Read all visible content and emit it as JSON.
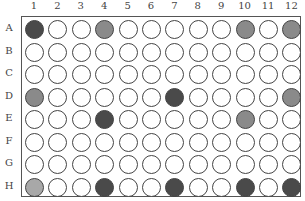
{
  "plate": {
    "columns": [
      "1",
      "2",
      "3",
      "4",
      "5",
      "6",
      "7",
      "8",
      "9",
      "10",
      "11",
      "12"
    ],
    "rows": [
      "A",
      "B",
      "C",
      "D",
      "E",
      "F",
      "G",
      "H"
    ],
    "fill_colors": {
      "empty": "#ffffff",
      "dark": "#4a4a4a",
      "medium": "#8a8a8a",
      "light": "#a8a8a8"
    },
    "wells": [
      [
        "dark",
        "empty",
        "empty",
        "medium",
        "empty",
        "empty",
        "empty",
        "empty",
        "empty",
        "medium",
        "empty",
        "medium"
      ],
      [
        "empty",
        "empty",
        "empty",
        "empty",
        "empty",
        "empty",
        "empty",
        "empty",
        "empty",
        "empty",
        "empty",
        "empty"
      ],
      [
        "empty",
        "empty",
        "empty",
        "empty",
        "empty",
        "empty",
        "empty",
        "empty",
        "empty",
        "empty",
        "empty",
        "empty"
      ],
      [
        "medium",
        "empty",
        "empty",
        "empty",
        "empty",
        "empty",
        "dark",
        "empty",
        "empty",
        "empty",
        "empty",
        "medium"
      ],
      [
        "empty",
        "empty",
        "empty",
        "dark",
        "empty",
        "empty",
        "empty",
        "empty",
        "empty",
        "medium",
        "empty",
        "empty"
      ],
      [
        "empty",
        "empty",
        "empty",
        "empty",
        "empty",
        "empty",
        "empty",
        "empty",
        "empty",
        "empty",
        "empty",
        "empty"
      ],
      [
        "empty",
        "empty",
        "empty",
        "empty",
        "empty",
        "empty",
        "empty",
        "empty",
        "empty",
        "empty",
        "empty",
        "empty"
      ],
      [
        "light",
        "empty",
        "empty",
        "dark",
        "empty",
        "empty",
        "dark",
        "empty",
        "empty",
        "dark",
        "empty",
        "dark"
      ]
    ]
  }
}
